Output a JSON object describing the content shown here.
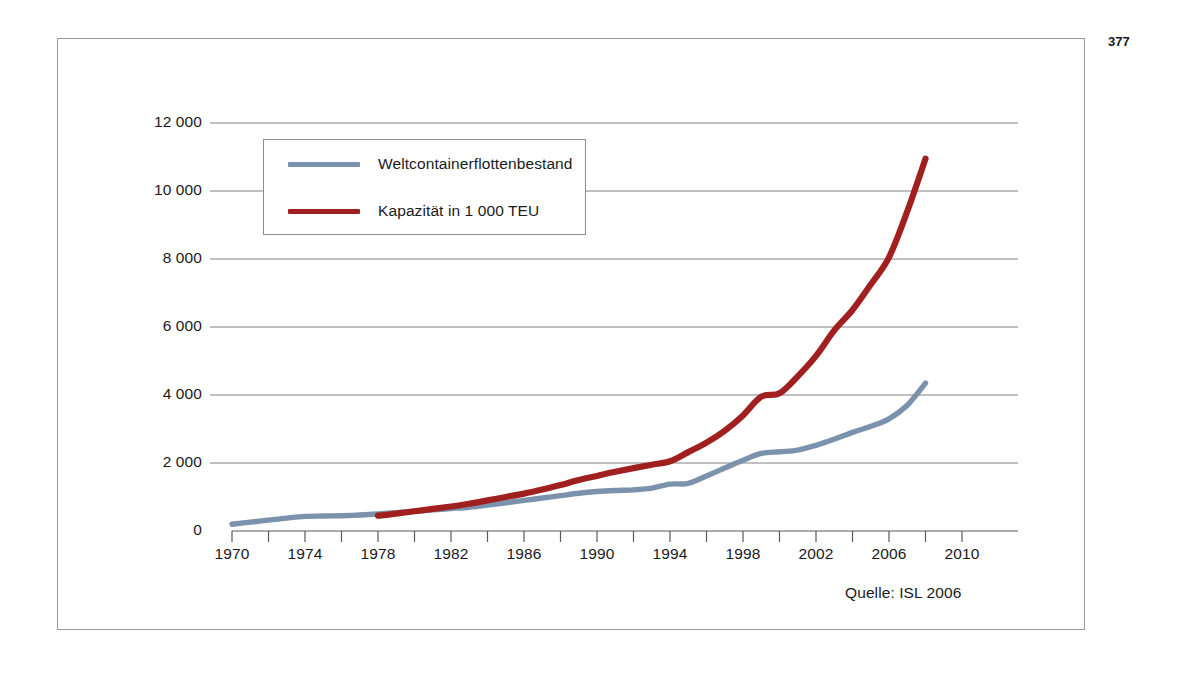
{
  "page": {
    "number": "377"
  },
  "figure": {
    "source_note": "Quelle: ISL 2006"
  },
  "colors": {
    "series_blue": "#7b92ad",
    "series_red": "#a02020",
    "gridline": "#808080",
    "axis": "#595959",
    "frame": "#9a9a9a",
    "text": "#1a1a1a"
  },
  "chart_data": {
    "type": "line",
    "title": "",
    "subtitle": "",
    "xlabel": "",
    "ylabel": "",
    "xlim": [
      1970,
      2010
    ],
    "ylim": [
      0,
      12000
    ],
    "xtick_step": 2,
    "xlabel_step": 4,
    "ytick_step": 2000,
    "grid": true,
    "legend_position": "upper-left-inside",
    "annotations": [
      "Quelle: ISL 2006"
    ],
    "ytick_labels": [
      "0",
      "2 000",
      "4 000",
      "6 000",
      "8 000",
      "10 000",
      "12 000"
    ],
    "ytick_values": [
      0,
      2000,
      4000,
      6000,
      8000,
      10000,
      12000
    ],
    "xtick_values": [
      1970,
      1972,
      1974,
      1976,
      1978,
      1980,
      1982,
      1984,
      1986,
      1988,
      1990,
      1992,
      1994,
      1996,
      1998,
      2000,
      2002,
      2004,
      2006,
      2008,
      2010
    ],
    "xtick_labels": [
      "1970",
      "",
      "1974",
      "",
      "1978",
      "",
      "1982",
      "",
      "1986",
      "",
      "1990",
      "",
      "1994",
      "",
      "1998",
      "",
      "2002",
      "",
      "2006",
      "",
      "2010"
    ],
    "series": [
      {
        "name": "Weltcontainerflottenbestand",
        "color": "#7b92ad",
        "x": [
          1970,
          1971,
          1972,
          1973,
          1974,
          1975,
          1976,
          1977,
          1978,
          1979,
          1980,
          1981,
          1982,
          1983,
          1984,
          1985,
          1986,
          1987,
          1988,
          1989,
          1990,
          1991,
          1992,
          1993,
          1994,
          1995,
          1996,
          1997,
          1998,
          1999,
          2000,
          2001,
          2002,
          2003,
          2004,
          2005,
          2006,
          2007,
          2008
        ],
        "values": [
          200,
          260,
          320,
          380,
          430,
          440,
          450,
          470,
          500,
          540,
          580,
          620,
          660,
          700,
          760,
          830,
          900,
          970,
          1040,
          1110,
          1160,
          1190,
          1210,
          1260,
          1380,
          1400,
          1620,
          1850,
          2080,
          2280,
          2330,
          2380,
          2520,
          2700,
          2900,
          3080,
          3300,
          3700,
          4350
        ]
      },
      {
        "name": "Kapazität in 1 000 TEU",
        "color": "#a02020",
        "x": [
          1978,
          1979,
          1980,
          1981,
          1982,
          1983,
          1984,
          1985,
          1986,
          1987,
          1988,
          1989,
          1990,
          1991,
          1992,
          1993,
          1994,
          1995,
          1996,
          1997,
          1998,
          1999,
          2000,
          2001,
          2002,
          2003,
          2004,
          2005,
          2006,
          2007,
          2008
        ],
        "values": [
          450,
          510,
          580,
          650,
          720,
          800,
          900,
          1000,
          1100,
          1220,
          1350,
          1500,
          1620,
          1740,
          1850,
          1950,
          2050,
          2320,
          2600,
          2950,
          3400,
          3950,
          4050,
          4550,
          5150,
          5900,
          6500,
          7250,
          8050,
          9400,
          10950
        ]
      }
    ]
  },
  "legend": {
    "items": [
      {
        "label": "Weltcontainerflottenbestand",
        "color": "#7b92ad"
      },
      {
        "label": "Kapazität in 1 000 TEU",
        "color": "#a02020"
      }
    ]
  }
}
